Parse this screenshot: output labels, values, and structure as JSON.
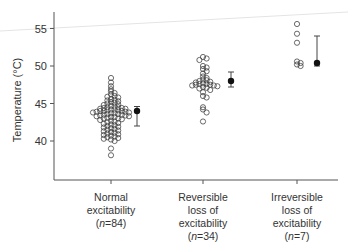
{
  "chart_data": {
    "type": "scatter",
    "title": "",
    "xlabel": "",
    "ylabel": "Temperature (°C)",
    "ylim": [
      35.2,
      57
    ],
    "yticks": [
      40,
      45,
      50,
      55
    ],
    "grid": false,
    "legend": null,
    "categories": [
      {
        "lines": [
          "Normal",
          "excitability",
          "(n=84)"
        ],
        "n": 84
      },
      {
        "lines": [
          "Reversible",
          "loss of",
          "excitability",
          "(n=34)"
        ],
        "n": 34
      },
      {
        "lines": [
          "Irreversible",
          "loss of",
          "excitability",
          "(n=7)"
        ],
        "n": 7
      }
    ],
    "series": [
      {
        "name": "Normal excitability",
        "points": [
          48.4,
          47.8,
          47.3,
          46.9,
          46.6,
          46.4,
          46.2,
          46.0,
          45.9,
          45.8,
          45.6,
          45.5,
          45.4,
          45.3,
          45.2,
          45.1,
          45.0,
          44.9,
          44.8,
          44.7,
          44.6,
          44.5,
          44.5,
          44.4,
          44.4,
          44.3,
          44.3,
          44.2,
          44.2,
          44.1,
          44.1,
          44.0,
          44.0,
          44.0,
          43.9,
          43.9,
          43.8,
          43.8,
          43.7,
          43.7,
          43.6,
          43.6,
          43.5,
          43.5,
          43.4,
          43.4,
          43.3,
          43.3,
          43.2,
          43.2,
          43.1,
          43.0,
          43.0,
          42.9,
          42.8,
          42.7,
          42.6,
          42.5,
          42.4,
          42.3,
          42.2,
          42.1,
          42.0,
          41.9,
          41.8,
          41.7,
          41.6,
          41.5,
          41.4,
          41.3,
          41.2,
          41.1,
          41.0,
          40.9,
          40.8,
          40.7,
          40.6,
          40.5,
          40.4,
          40.3,
          40.2,
          40.0,
          39.0,
          38.1
        ],
        "mean": 44.0,
        "error_low": 42.0,
        "error_high": 44.6
      },
      {
        "name": "Reversible loss of excitability",
        "points": [
          51.2,
          51.0,
          50.8,
          50.0,
          49.8,
          49.6,
          49.3,
          49.0,
          48.6,
          48.4,
          48.2,
          48.1,
          48.0,
          47.9,
          47.8,
          47.7,
          47.6,
          47.6,
          47.5,
          47.5,
          47.4,
          47.4,
          47.3,
          47.2,
          47.1,
          47.0,
          46.8,
          46.5,
          46.0,
          45.8,
          44.5,
          44.2,
          43.8,
          42.6
        ],
        "mean": 48.0,
        "error_low": 47.2,
        "error_high": 49.2
      },
      {
        "name": "Irreversible loss of excitability",
        "points": [
          55.6,
          54.3,
          53.1,
          50.6,
          50.4,
          50.2,
          50.0
        ],
        "mean": 50.4,
        "error_low": 50.0,
        "error_high": 54.0
      }
    ]
  }
}
